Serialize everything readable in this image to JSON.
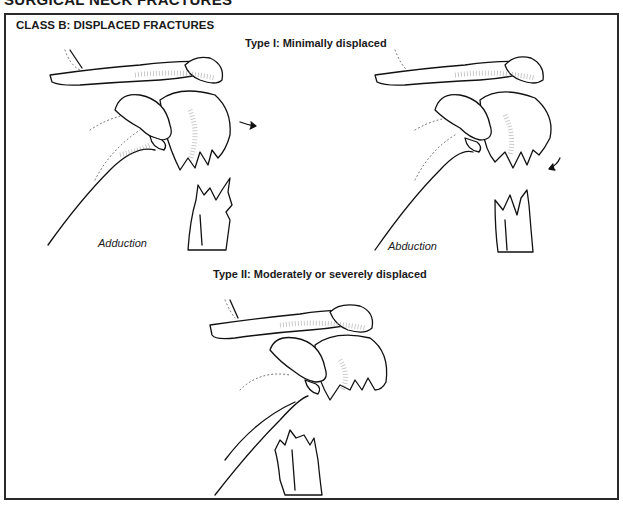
{
  "page_header": "SURGICAL NECK FRACTURES",
  "class_title": "CLASS B: DISPLACED FRACTURES",
  "type1": {
    "title": "Type I: Minimally displaced",
    "figures": [
      {
        "caption": "Adduction",
        "arrow": "right-arrow"
      },
      {
        "caption": "Abduction",
        "arrow": "curved-down-arrow"
      }
    ]
  },
  "type2": {
    "title": "Type II: Moderately or severely displaced"
  },
  "colors": {
    "line": "#111111",
    "frame": "#2a2a2a",
    "background": "#ffffff"
  }
}
